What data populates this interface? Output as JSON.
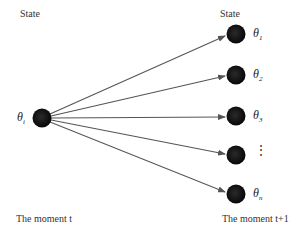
{
  "diagram": {
    "left": {
      "header": "State",
      "footer": "The moment t",
      "node": {
        "symbol": "θ",
        "subscript": "i"
      }
    },
    "right": {
      "header": "State",
      "footer": "The moment t+1",
      "nodes": [
        {
          "symbol": "θ",
          "subscript": "1"
        },
        {
          "symbol": "θ",
          "subscript": "2"
        },
        {
          "symbol": "θ",
          "subscript": "3"
        },
        {
          "symbol": "⋮",
          "subscript": ""
        },
        {
          "symbol": "θ",
          "subscript": "n"
        }
      ]
    },
    "colors": {
      "node": "#111111",
      "arrow": "#555555",
      "text": "#333333"
    }
  }
}
